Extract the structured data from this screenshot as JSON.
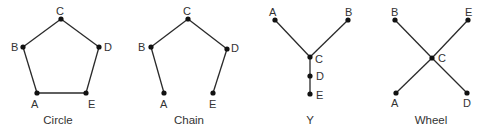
{
  "diagrams": [
    {
      "title": "Circle",
      "title_pos": [
        58,
        124
      ],
      "nodes": [
        {
          "id": "A",
          "x": 37,
          "y": 93,
          "lx": 31,
          "ly": 108
        },
        {
          "id": "B",
          "x": 23,
          "y": 47,
          "lx": 11,
          "ly": 51
        },
        {
          "id": "C",
          "x": 61,
          "y": 19,
          "lx": 56,
          "ly": 15
        },
        {
          "id": "D",
          "x": 99,
          "y": 47,
          "lx": 104,
          "ly": 51
        },
        {
          "id": "E",
          "x": 86,
          "y": 93,
          "lx": 88,
          "ly": 108
        }
      ],
      "edges": [
        [
          "A",
          "B"
        ],
        [
          "B",
          "C"
        ],
        [
          "C",
          "D"
        ],
        [
          "D",
          "E"
        ],
        [
          "E",
          "A"
        ]
      ]
    },
    {
      "title": "Chain",
      "title_pos": [
        189,
        124
      ],
      "nodes": [
        {
          "id": "A",
          "x": 164,
          "y": 93,
          "lx": 160,
          "ly": 108
        },
        {
          "id": "B",
          "x": 151,
          "y": 47,
          "lx": 138,
          "ly": 51
        },
        {
          "id": "C",
          "x": 188,
          "y": 19,
          "lx": 183,
          "ly": 15
        },
        {
          "id": "D",
          "x": 227,
          "y": 49,
          "lx": 231,
          "ly": 52
        },
        {
          "id": "E",
          "x": 213,
          "y": 93,
          "lx": 209,
          "ly": 108
        }
      ],
      "edges": [
        [
          "A",
          "B"
        ],
        [
          "B",
          "C"
        ],
        [
          "C",
          "D"
        ],
        [
          "D",
          "E"
        ]
      ]
    },
    {
      "title": "Y",
      "title_pos": [
        310,
        124
      ],
      "nodes": [
        {
          "id": "A",
          "x": 275,
          "y": 20,
          "lx": 269,
          "ly": 16
        },
        {
          "id": "B",
          "x": 348,
          "y": 20,
          "lx": 345,
          "ly": 16
        },
        {
          "id": "C",
          "x": 310,
          "y": 57,
          "lx": 315,
          "ly": 63
        },
        {
          "id": "D",
          "x": 310,
          "y": 76,
          "lx": 316,
          "ly": 80
        },
        {
          "id": "E",
          "x": 310,
          "y": 94,
          "lx": 316,
          "ly": 99
        }
      ],
      "edges": [
        [
          "A",
          "C"
        ],
        [
          "B",
          "C"
        ],
        [
          "C",
          "D"
        ],
        [
          "D",
          "E"
        ]
      ]
    },
    {
      "title": "Wheel",
      "title_pos": [
        431,
        124
      ],
      "nodes": [
        {
          "id": "A",
          "x": 396,
          "y": 93,
          "lx": 391,
          "ly": 107
        },
        {
          "id": "B",
          "x": 395,
          "y": 20,
          "lx": 391,
          "ly": 16
        },
        {
          "id": "C",
          "x": 432,
          "y": 58,
          "lx": 438,
          "ly": 62
        },
        {
          "id": "D",
          "x": 467,
          "y": 93,
          "lx": 463,
          "ly": 107
        },
        {
          "id": "E",
          "x": 468,
          "y": 20,
          "lx": 465,
          "ly": 16
        }
      ],
      "edges": [
        [
          "B",
          "C"
        ],
        [
          "C",
          "D"
        ],
        [
          "E",
          "C"
        ],
        [
          "C",
          "A"
        ]
      ]
    }
  ]
}
